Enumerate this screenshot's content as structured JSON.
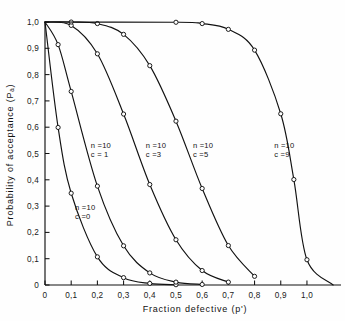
{
  "chart_data": {
    "type": "line",
    "title": "",
    "xlabel": "Fraction defective (p')",
    "ylabel": "Probability of acceptance (Pₐ)",
    "xlim": [
      0,
      1.13
    ],
    "ylim": [
      0,
      1.0
    ],
    "grid": false,
    "legend": "inline-annotations",
    "x_ticks": [
      0,
      0.1,
      0.2,
      0.3,
      0.4,
      0.5,
      0.6,
      0.7,
      0.8,
      0.9,
      1.0
    ],
    "x_tick_labels": [
      "0",
      "0,1",
      "0,2",
      "0,3",
      "0,4",
      "0,5",
      "0,6",
      "0,7",
      "0,8",
      "0,9",
      "1,0"
    ],
    "y_ticks": [
      0,
      0.1,
      0.2,
      0.3,
      0.4,
      0.5,
      0.6,
      0.7,
      0.8,
      0.9,
      1.0
    ],
    "y_tick_labels": [
      "0",
      "0,1",
      "0,2",
      "0,3",
      "0,4",
      "0,5",
      "0,6",
      "0,7",
      "0,8",
      "0,9",
      "1,0"
    ],
    "marker": "open-circle",
    "series": [
      {
        "name": "n=10, c=0",
        "label_line1": "n =10",
        "label_line2": "c =0",
        "label_x": 0.115,
        "label_y": 0.285,
        "x": [
          0,
          0.05,
          0.1,
          0.2,
          0.3,
          0.4,
          0.5
        ],
        "y": [
          1.0,
          0.599,
          0.349,
          0.107,
          0.028,
          0.006,
          0.001
        ]
      },
      {
        "name": "n=10, c=1",
        "label_line1": "n =10",
        "label_line2": "c = 1",
        "label_x": 0.175,
        "label_y": 0.52,
        "x": [
          0,
          0.05,
          0.1,
          0.2,
          0.3,
          0.4,
          0.5,
          0.6
        ],
        "y": [
          1.0,
          0.914,
          0.736,
          0.376,
          0.149,
          0.046,
          0.011,
          0.002
        ]
      },
      {
        "name": "n=10, c=3",
        "label_line1": "n =10",
        "label_line2": "c =3",
        "label_x": 0.385,
        "label_y": 0.52,
        "x": [
          0,
          0.1,
          0.2,
          0.3,
          0.4,
          0.5,
          0.6,
          0.7
        ],
        "y": [
          1.0,
          0.987,
          0.879,
          0.65,
          0.382,
          0.172,
          0.055,
          0.011
        ]
      },
      {
        "name": "n=10, c=5",
        "label_line1": "n =10",
        "label_line2": "c =5",
        "label_x": 0.565,
        "label_y": 0.52,
        "x": [
          0,
          0.1,
          0.2,
          0.3,
          0.4,
          0.5,
          0.6,
          0.7,
          0.8
        ],
        "y": [
          1.0,
          0.9999,
          0.994,
          0.953,
          0.834,
          0.623,
          0.367,
          0.15,
          0.033
        ]
      },
      {
        "name": "n=10, c=9",
        "label_line1": "n =10",
        "label_line2": "c =9",
        "label_x": 0.875,
        "label_y": 0.52,
        "x": [
          0,
          0.5,
          0.6,
          0.7,
          0.8,
          0.9,
          0.95,
          1.0,
          1.1
        ],
        "y": [
          1.0,
          0.999,
          0.994,
          0.972,
          0.893,
          0.651,
          0.401,
          0.096,
          0.0
        ]
      }
    ]
  },
  "figure": {
    "caption_fragment": ""
  }
}
